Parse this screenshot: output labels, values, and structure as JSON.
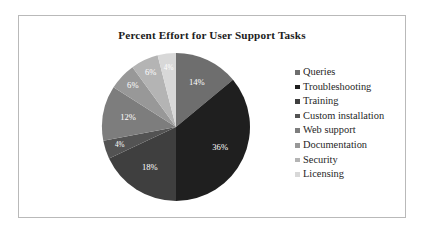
{
  "frame": {
    "border_color": "#b9b9b9",
    "background": "#ffffff"
  },
  "chart_data": {
    "type": "pie",
    "title": "Percent Effort for User Support Tasks",
    "xlabel": "",
    "ylabel": "",
    "legend_position": "right",
    "grid": false,
    "units": "percent",
    "total": 100,
    "start_angle_deg": 0,
    "direction": "clockwise",
    "categories": [
      "Queries",
      "Troubleshooting",
      "Training",
      "Custom installation",
      "Web support",
      "Documentation",
      "Security",
      "Licensing"
    ],
    "values": [
      14,
      36,
      18,
      4,
      12,
      6,
      6,
      4
    ],
    "data_labels": [
      "14%",
      "36%",
      "18%",
      "4%",
      "12%",
      "6%",
      "6%",
      "4%"
    ],
    "colors": [
      "#6e6e6e",
      "#1f1f1f",
      "#3f3f3f",
      "#535353",
      "#7d7d7d",
      "#989898",
      "#b4b4b4",
      "#d8d8d8"
    ]
  },
  "legend": {
    "items": [
      {
        "label": "Queries",
        "color": "#6e6e6e"
      },
      {
        "label": "Troubleshooting",
        "color": "#1f1f1f"
      },
      {
        "label": "Training",
        "color": "#3f3f3f"
      },
      {
        "label": "Custom installation",
        "color": "#535353"
      },
      {
        "label": "Web support",
        "color": "#7d7d7d"
      },
      {
        "label": "Documentation",
        "color": "#989898"
      },
      {
        "label": "Security",
        "color": "#b4b4b4"
      },
      {
        "label": "Licensing",
        "color": "#d8d8d8"
      }
    ]
  }
}
